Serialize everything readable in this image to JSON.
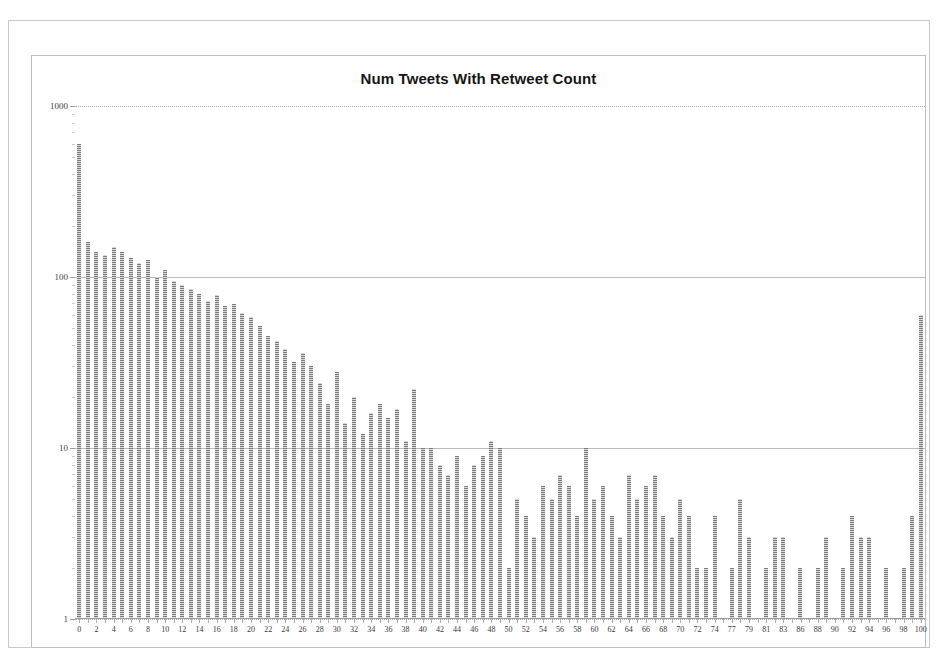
{
  "chart_data": {
    "type": "bar",
    "title": "Num Tweets With Retweet Count",
    "xlabel": "",
    "ylabel": "",
    "yscale": "log",
    "ylim": [
      1,
      1000
    ],
    "ytick_labels": [
      "1",
      "10",
      "100",
      "1000"
    ],
    "ytick_values": [
      1,
      10,
      100,
      1000
    ],
    "grid": true,
    "legend": false,
    "legend_position": "none",
    "bar_color": "#a8a8a8",
    "categories": [
      "0",
      "1",
      "2",
      "3",
      "4",
      "5",
      "6",
      "7",
      "8",
      "9",
      "10",
      "11",
      "12",
      "13",
      "14",
      "15",
      "16",
      "17",
      "18",
      "19",
      "20",
      "21",
      "22",
      "23",
      "24",
      "25",
      "26",
      "27",
      "28",
      "29",
      "30",
      "31",
      "32",
      "33",
      "34",
      "35",
      "36",
      "37",
      "38",
      "39",
      "40",
      "41",
      "42",
      "43",
      "44",
      "45",
      "46",
      "47",
      "48",
      "49",
      "50",
      "51",
      "52",
      "53",
      "54",
      "55",
      "56",
      "57",
      "58",
      "59",
      "60",
      "61",
      "62",
      "63",
      "64",
      "65",
      "66",
      "67",
      "68",
      "69",
      "70",
      "71",
      "72",
      "73",
      "74",
      "75",
      "77",
      "78",
      "79",
      "80",
      "81",
      "82",
      "83",
      "85",
      "86",
      "87",
      "88",
      "89",
      "90",
      "91",
      "92",
      "93",
      "94",
      "95",
      "96",
      "97",
      "98",
      "99",
      "100"
    ],
    "x_tick_labels_shown": [
      "0",
      "2",
      "4",
      "6",
      "8",
      "10",
      "12",
      "14",
      "16",
      "18",
      "20",
      "22",
      "24",
      "26",
      "28",
      "30",
      "32",
      "34",
      "36",
      "38",
      "40",
      "42",
      "44",
      "46",
      "48",
      "50",
      "52",
      "54",
      "56",
      "58",
      "60",
      "62",
      "64",
      "66",
      "68",
      "70",
      "72",
      "74",
      "77",
      "79",
      "81",
      "83",
      "86",
      "88",
      "90",
      "92",
      "94",
      "96",
      "98",
      "100"
    ],
    "values": [
      600,
      160,
      140,
      135,
      150,
      140,
      130,
      120,
      125,
      100,
      110,
      95,
      90,
      85,
      80,
      72,
      78,
      68,
      70,
      62,
      58,
      52,
      45,
      42,
      38,
      32,
      36,
      30,
      24,
      18,
      28,
      14,
      20,
      12,
      16,
      18,
      15,
      17,
      11,
      22,
      10,
      10,
      8,
      7,
      9,
      6,
      8,
      9,
      11,
      10,
      2,
      5,
      4,
      3,
      6,
      5,
      7,
      6,
      4,
      10,
      5,
      6,
      4,
      3,
      7,
      5,
      6,
      7,
      4,
      3,
      5,
      4,
      2,
      2,
      4,
      1,
      2,
      5,
      3,
      1,
      2,
      3,
      3,
      1,
      2,
      1,
      2,
      3,
      1,
      2,
      4,
      3,
      3,
      1,
      2,
      1,
      2,
      4,
      60
    ]
  }
}
